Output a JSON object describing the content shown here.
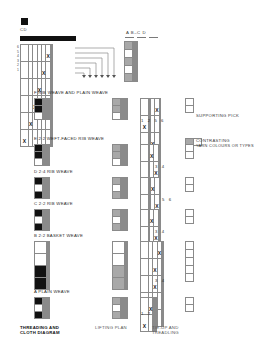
{
  "key": {
    "square_label": "CD"
  },
  "top_diagram": {
    "threading_row_numbers": [
      "6",
      "5",
      "4",
      "3",
      "2",
      "1"
    ],
    "cloth_header": "A  B–C  D",
    "threading_marks": [
      {
        "row": 0,
        "col": 5,
        "mark": "X"
      },
      {
        "row": 1,
        "col": 4,
        "mark": "X"
      },
      {
        "row": 2,
        "col": 3,
        "mark": "X"
      },
      {
        "row": 3,
        "col": 2,
        "mark": "X"
      },
      {
        "row": 4,
        "col": 1,
        "mark": "X"
      },
      {
        "row": 5,
        "col": 0,
        "mark": "X"
      }
    ]
  },
  "legend": [
    {
      "id": "supporting-pick",
      "label": "SUPPORTING PICK",
      "swatch": "white"
    },
    {
      "id": "contrasting-yarn",
      "label_line1": "CONTRASTING",
      "label_line2": "YARN COLOURS OR TYPES",
      "swatch": "split-grey-white"
    }
  ],
  "sections": [
    {
      "id": "f",
      "label": "F  RIB WEAVE AND PLAIN WEAVE",
      "treadling_numbers": "1 2      5 6"
    },
    {
      "id": "e",
      "label": "E  2:2 WEFT-FACED RIB WEAVE",
      "treadling_numbers": "3 4"
    },
    {
      "id": "d",
      "label": "D  2:4 RIB WEAVE",
      "treadling_numbers": "5 6"
    },
    {
      "id": "c",
      "label": "C  2:2 RIB WEAVE",
      "treadling_numbers": "3 4"
    },
    {
      "id": "b",
      "label": "B  2:2 BASKET WEAVE",
      "treadling_numbers": "3 4"
    },
    {
      "id": "a",
      "label": "A  PLAIN WEAVE",
      "treadling_numbers": "1 2"
    }
  ],
  "footer": {
    "col1_line1": "THREADING AND",
    "col1_line2": "CLOTH DIAGRAM",
    "col2_line1": "LIFTING PLAN",
    "col2_line2": "",
    "col3_line1": "TIE-UP AND",
    "col3_line2": "TREADLING"
  },
  "colors": {
    "black": "#111111",
    "grey": "#a8a8a8",
    "dark_grey": "#7d7d7d",
    "light_grey": "#d2d2d2",
    "rule": "#8a8a8a"
  }
}
